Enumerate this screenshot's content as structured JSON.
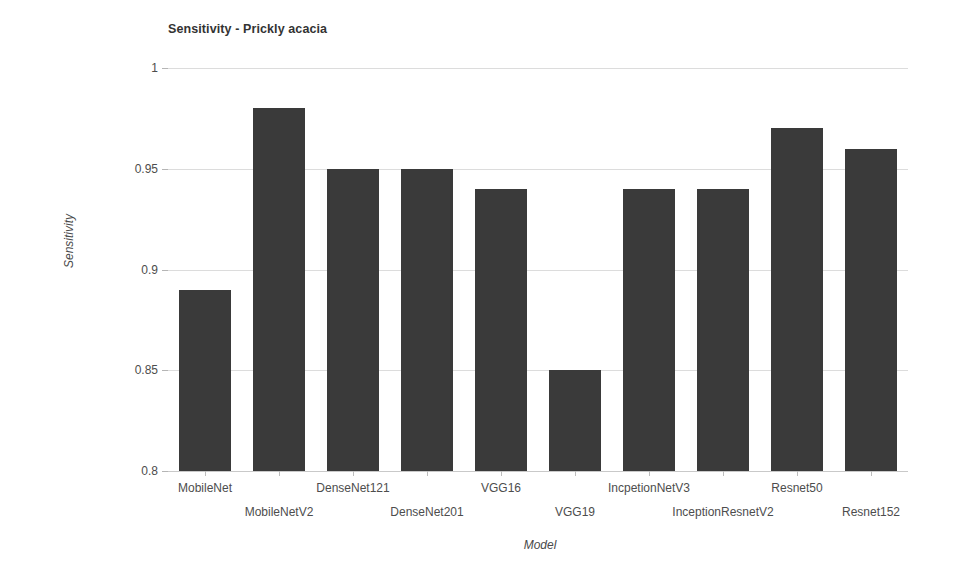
{
  "chart_data": {
    "type": "bar",
    "title": "Sensitivity - Prickly acacia",
    "xlabel": "Model",
    "ylabel": "Sensitivity",
    "ylim": [
      0.8,
      1.0
    ],
    "yticks": [
      "0.8",
      "0.85",
      "0.9",
      "0.95",
      "1"
    ],
    "ytick_values": [
      0.8,
      0.85,
      0.9,
      0.95,
      1.0
    ],
    "grid": true,
    "legend": "none",
    "bar_color": "#3a3a3a",
    "categories": [
      "MobileNet",
      "MobileNetV2",
      "DenseNet121",
      "DenseNet201",
      "VGG16",
      "VGG19",
      "IncpetionNetV3",
      "InceptionResnetV2",
      "Resnet50",
      "Resnet152"
    ],
    "values": [
      0.89,
      0.98,
      0.95,
      0.95,
      0.94,
      0.85,
      0.94,
      0.94,
      0.97,
      0.96
    ]
  }
}
